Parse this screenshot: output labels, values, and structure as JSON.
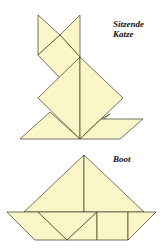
{
  "figures": [
    {
      "id": "cat",
      "title_line1": "Sitzende",
      "title_line2": "Katze"
    },
    {
      "id": "boat",
      "title_line1": "Boot"
    }
  ],
  "colors": {
    "fill": "#fbf6c8",
    "stroke": "#3a3a2a",
    "background": "#ffffff"
  }
}
